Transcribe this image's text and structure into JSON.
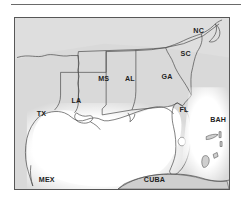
{
  "figure": {
    "kind": "map",
    "title_rule": true,
    "region_description": "Southeastern United States and Gulf of Mexico",
    "frame": {
      "border_color": "#575757"
    }
  },
  "colors": {
    "land_fill": "#d9d9d9",
    "water_fill": "#ffffff",
    "outline": "#4a4a4a",
    "label_text": "#1f1f1f",
    "rule": "#6a6a6a"
  },
  "map": {
    "labels": [
      {
        "id": "nc",
        "text": "NC",
        "x": 180,
        "y": 15,
        "name": "label-north-carolina"
      },
      {
        "id": "sc",
        "text": "SC",
        "x": 167,
        "y": 38,
        "name": "label-south-carolina"
      },
      {
        "id": "ga",
        "text": "GA",
        "x": 148,
        "y": 62,
        "name": "label-georgia"
      },
      {
        "id": "al",
        "text": "AL",
        "x": 111,
        "y": 64,
        "name": "label-alabama"
      },
      {
        "id": "ms",
        "text": "MS",
        "x": 84,
        "y": 64,
        "name": "label-mississippi"
      },
      {
        "id": "la",
        "text": "LA",
        "x": 57,
        "y": 86,
        "name": "label-louisiana"
      },
      {
        "id": "tx",
        "text": "TX",
        "x": 22,
        "y": 99,
        "name": "label-texas"
      },
      {
        "id": "fl",
        "text": "FL",
        "x": 166,
        "y": 95,
        "name": "label-florida"
      },
      {
        "id": "bah",
        "text": "BAH",
        "x": 201,
        "y": 105,
        "name": "label-bahamas"
      },
      {
        "id": "cuba",
        "text": "CUBA",
        "x": 134,
        "y": 166,
        "name": "label-cuba"
      },
      {
        "id": "mex",
        "text": "MEX",
        "x": 28,
        "y": 166,
        "name": "label-mexico"
      }
    ]
  }
}
